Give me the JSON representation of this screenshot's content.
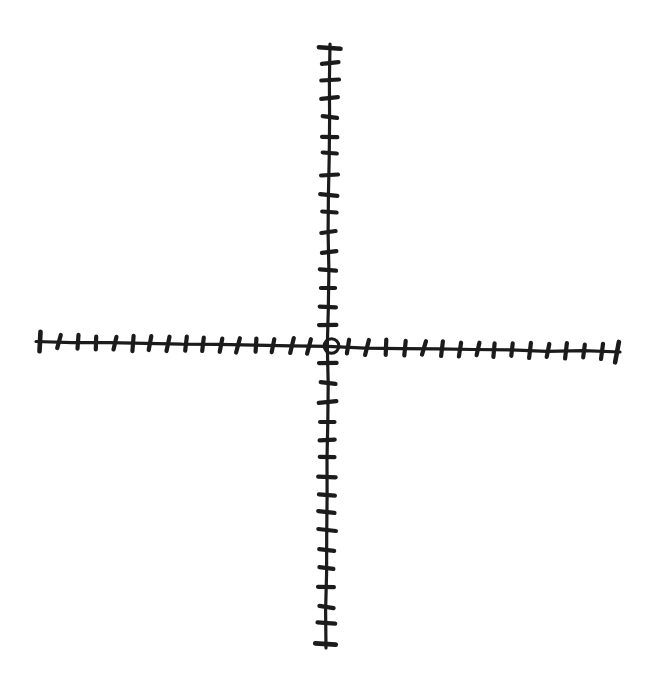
{
  "figure": {
    "background_color": "#ffffff",
    "ink_color": "#1b1b1b",
    "canvas": {
      "width": 660,
      "height": 675
    },
    "x_axis": {
      "start": [
        36,
        341.5
      ],
      "end": [
        620,
        352
      ],
      "tick_count_left": 16,
      "tick_count_right": 16,
      "tick_length": 14,
      "end_tick_length": 20,
      "ticks_x": [
        40,
        59,
        78,
        96,
        115,
        133,
        150,
        168,
        186,
        203,
        221,
        238,
        256,
        273,
        292,
        309,
        348,
        367,
        386,
        405,
        424,
        442,
        460,
        478,
        494,
        512,
        530,
        548,
        566,
        584,
        602,
        617
      ]
    },
    "y_axis": {
      "start": [
        330,
        44
      ],
      "end": [
        326,
        648
      ],
      "tick_count_top": 16,
      "tick_count_bottom": 16,
      "tick_length": 16,
      "end_tick_length": 21,
      "ticks_y": [
        48,
        63,
        80,
        98,
        117,
        137,
        153,
        175,
        195,
        212,
        232,
        252,
        270,
        288,
        307,
        325,
        363,
        383,
        402,
        422,
        440,
        457,
        477,
        495,
        512,
        530,
        550,
        568,
        587,
        607,
        623,
        644
      ]
    },
    "origin_marker": {
      "shape": "open-circle",
      "center": [
        331.5,
        346
      ],
      "radius": 7.3
    }
  }
}
